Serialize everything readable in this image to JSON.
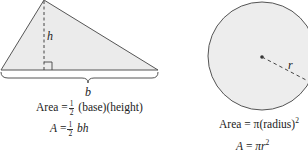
{
  "triangle": {
    "height_label": "h",
    "base_label": "b",
    "formula_word": {
      "lhs": "Area",
      "eq": "=",
      "frac_num": "1",
      "frac_den": "2",
      "rhs": "(base)(height)"
    },
    "formula_symbolic": {
      "lhs": "A",
      "eq": "=",
      "frac_num": "1",
      "frac_den": "2",
      "rhs": "bh"
    }
  },
  "circle": {
    "radius_label": "r",
    "formula_word": {
      "lhs": "Area",
      "eq": "=",
      "rhs": "π(radius)",
      "exp": "2"
    },
    "formula_symbolic": {
      "lhs": "A",
      "eq": "=",
      "rhs": "πr",
      "exp": "2"
    }
  },
  "colors": {
    "fill": "#ebebeb",
    "stroke": "#555555"
  }
}
